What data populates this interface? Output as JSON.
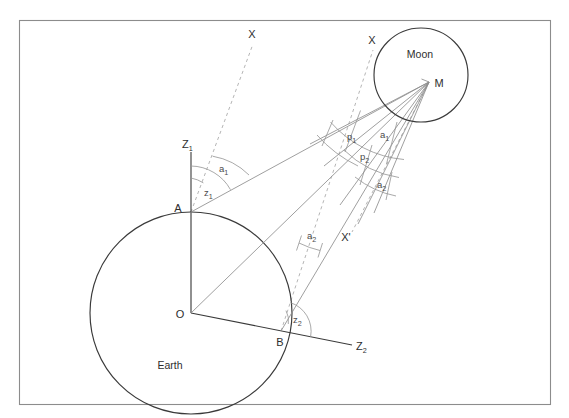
{
  "figure": {
    "frame": {
      "x": 19,
      "y": 20,
      "width": 532,
      "height": 385,
      "stroke": "#8c8c8c"
    }
  },
  "bodies": {
    "earth": {
      "label": "Earth",
      "center_label": "O",
      "cx": 191,
      "cy": 313,
      "r": 101,
      "label_x": 170,
      "label_y": 369,
      "center_label_x": 180,
      "center_label_y": 317
    },
    "moon": {
      "label": "Moon",
      "center_label": "M",
      "cx": 421,
      "cy": 75,
      "r": 47,
      "label_x": 420,
      "label_y": 58,
      "center_label_x": 437,
      "center_label_y": 87
    }
  },
  "points": [
    {
      "name": "A",
      "label": "A",
      "x": 191,
      "y": 212,
      "label_x": 178,
      "label_y": 212
    },
    {
      "name": "B",
      "label": "B",
      "x": 281,
      "y": 331,
      "label_x": 278,
      "label_y": 344
    },
    {
      "name": "O",
      "label": "O",
      "x": 191,
      "y": 313,
      "label_x": 180,
      "label_y": 317
    },
    {
      "name": "M",
      "label": "M",
      "x": 429,
      "y": 82,
      "label_x": 437,
      "label_y": 87
    }
  ],
  "axes": [
    {
      "name": "zenith-a",
      "label": "Z",
      "subscript": "1",
      "label_x": 186,
      "label_y": 147
    },
    {
      "name": "zenith-b",
      "label": "Z",
      "subscript": "2",
      "label_x": 359,
      "label_y": 351
    }
  ],
  "direction_labels": [
    {
      "name": "star-direction-a",
      "label": "X",
      "x": 252,
      "y": 37
    },
    {
      "name": "star-direction-b",
      "label": "X",
      "x": 372,
      "y": 43
    },
    {
      "name": "star-direction-b-prime",
      "label": "X'",
      "x": 346,
      "y": 240
    }
  ],
  "angles": [
    {
      "name": "zenith-distance-1",
      "label": "z",
      "subscript": "1",
      "label_x": 206,
      "label_y": 195
    },
    {
      "name": "altitude-angle-1",
      "label": "a",
      "subscript": "1",
      "label_x": 222,
      "label_y": 171
    },
    {
      "name": "parallax-1",
      "label": "p",
      "subscript": "1",
      "label_x": 350,
      "label_y": 139
    },
    {
      "name": "apparent-angle-1",
      "label": "a",
      "subscript": "1",
      "label_x": 383,
      "label_y": 137
    },
    {
      "name": "parallax-2",
      "label": "p",
      "subscript": "2",
      "label_x": 363,
      "label_y": 159
    },
    {
      "name": "apparent-angle-2",
      "label": "a",
      "subscript": "2",
      "label_x": 380,
      "label_y": 187
    },
    {
      "name": "altitude-angle-2",
      "label": "a",
      "subscript": "2",
      "label_x": 310,
      "label_y": 238
    },
    {
      "name": "zenith-distance-2",
      "label": "z",
      "subscript": "2",
      "label_x": 296,
      "label_y": 322
    }
  ],
  "colors": {
    "frame": "#8c8c8c",
    "body_outline": "#3a3a3a",
    "axis": "#3a3a3a",
    "sight_line": "#8e8e8e",
    "dashed_line": "#a8a8a8",
    "arc": "#9a9a9a",
    "text": "#2e2e2e",
    "background": "#ffffff"
  }
}
